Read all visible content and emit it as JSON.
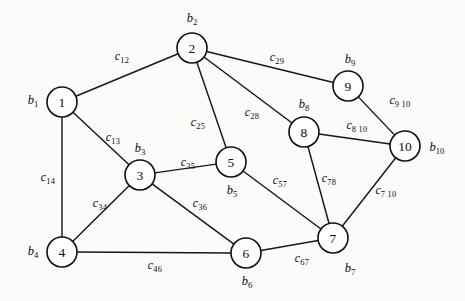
{
  "diagram": {
    "type": "undirected-weighted-graph",
    "title": "",
    "background_color": "#fbfbfa",
    "node_fill": "#ffffff",
    "stroke_color": "#17171a",
    "node_radius": 15,
    "nodes": [
      {
        "id": "1",
        "label": "1",
        "x": 62,
        "y": 102,
        "var": "b",
        "var_sub": "1",
        "var_x": 33,
        "var_y": 100
      },
      {
        "id": "2",
        "label": "2",
        "x": 192,
        "y": 48,
        "var": "b",
        "var_sub": "2",
        "var_x": 192,
        "var_y": 18
      },
      {
        "id": "3",
        "label": "3",
        "x": 140,
        "y": 175,
        "var": "b",
        "var_sub": "3",
        "var_x": 140,
        "var_y": 148
      },
      {
        "id": "4",
        "label": "4",
        "x": 62,
        "y": 252,
        "var": "b",
        "var_sub": "4",
        "var_x": 33,
        "var_y": 251
      },
      {
        "id": "5",
        "label": "5",
        "x": 231,
        "y": 162,
        "var": "b",
        "var_sub": "5",
        "var_x": 232,
        "var_y": 190
      },
      {
        "id": "6",
        "label": "6",
        "x": 246,
        "y": 253,
        "var": "b",
        "var_sub": "6",
        "var_x": 247,
        "var_y": 281
      },
      {
        "id": "7",
        "label": "7",
        "x": 333,
        "y": 238,
        "var": "b",
        "var_sub": "7",
        "var_x": 350,
        "var_y": 268
      },
      {
        "id": "8",
        "label": "8",
        "x": 304,
        "y": 132,
        "var": "b",
        "var_sub": "8",
        "var_x": 304,
        "var_y": 104
      },
      {
        "id": "9",
        "label": "9",
        "x": 348,
        "y": 86,
        "var": "b",
        "var_sub": "9",
        "var_x": 350,
        "var_y": 59
      },
      {
        "id": "10",
        "label": "10",
        "x": 405,
        "y": 146,
        "var": "b",
        "var_sub": "10",
        "var_x": 437,
        "var_y": 147
      }
    ],
    "edges": [
      {
        "from": "1",
        "to": "2",
        "cost": "c",
        "cost_sub": "12",
        "label_x": 122,
        "label_y": 56
      },
      {
        "from": "1",
        "to": "3",
        "cost": "c",
        "cost_sub": "13",
        "label_x": 113,
        "label_y": 137
      },
      {
        "from": "1",
        "to": "4",
        "cost": "c",
        "cost_sub": "14",
        "label_x": 48,
        "label_y": 177
      },
      {
        "from": "2",
        "to": "5",
        "cost": "c",
        "cost_sub": "25",
        "label_x": 198,
        "label_y": 122
      },
      {
        "from": "2",
        "to": "8",
        "cost": "c",
        "cost_sub": "28",
        "label_x": 252,
        "label_y": 112
      },
      {
        "from": "2",
        "to": "9",
        "cost": "c",
        "cost_sub": "29",
        "label_x": 277,
        "label_y": 57
      },
      {
        "from": "3",
        "to": "4",
        "cost": "c",
        "cost_sub": "34",
        "label_x": 100,
        "label_y": 203
      },
      {
        "from": "3",
        "to": "5",
        "cost": "c",
        "cost_sub": "35",
        "label_x": 188,
        "label_y": 162
      },
      {
        "from": "3",
        "to": "6",
        "cost": "c",
        "cost_sub": "36",
        "label_x": 200,
        "label_y": 203
      },
      {
        "from": "4",
        "to": "6",
        "cost": "c",
        "cost_sub": "46",
        "label_x": 155,
        "label_y": 265
      },
      {
        "from": "5",
        "to": "7",
        "cost": "c",
        "cost_sub": "57",
        "label_x": 280,
        "label_y": 180
      },
      {
        "from": "6",
        "to": "7",
        "cost": "c",
        "cost_sub": "67",
        "label_x": 302,
        "label_y": 258
      },
      {
        "from": "7",
        "to": "8",
        "cost": "c",
        "cost_sub": "78",
        "label_x": 329,
        "label_y": 178
      },
      {
        "from": "7",
        "to": "10",
        "cost": "c",
        "cost_sub": "7 10",
        "label_x": 386,
        "label_y": 190
      },
      {
        "from": "8",
        "to": "10",
        "cost": "c",
        "cost_sub": "8 10",
        "label_x": 357,
        "label_y": 125
      },
      {
        "from": "9",
        "to": "10",
        "cost": "c",
        "cost_sub": "9 10",
        "label_x": 400,
        "label_y": 100
      }
    ]
  }
}
